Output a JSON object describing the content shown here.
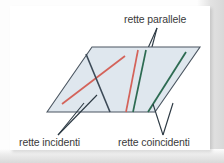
{
  "figure": {
    "title_visible": false,
    "language": "it",
    "labels": {
      "parallel": "rette parallele",
      "intersecting": "rette incidenti",
      "coincident": "rette coincidenti"
    },
    "colors": {
      "plane_fill": "#dfe7ee",
      "plane_stroke": "#4a5560",
      "line_red": "#d4635a",
      "line_green": "#2d6b52",
      "line_dark": "#3c4a57",
      "leader": "#2b3842",
      "text": "#3a3a3a",
      "card": "#ffffff",
      "backdrop": "#e2e2e2"
    },
    "plane": {
      "shape": "parallelogram",
      "points": "47,112 92,47 200,47 155,112"
    },
    "groups": [
      {
        "name": "rette incidenti",
        "kind": "intersecting",
        "description": "two lines crossing at a point inside the plane",
        "lines": [
          {
            "color": "#d4635a",
            "x1": 62,
            "y1": 104,
            "x2": 125,
            "y2": 56
          },
          {
            "color": "#3c4a57",
            "x1": 86,
            "y1": 54,
            "x2": 110,
            "y2": 112
          }
        ],
        "leaders": [
          {
            "x1": 58,
            "y1": 135,
            "x2": 97,
            "y2": 95
          },
          {
            "x1": 58,
            "y1": 135,
            "x2": 84,
            "y2": 103
          }
        ]
      },
      {
        "name": "rette parallele",
        "kind": "parallel",
        "description": "two lines that never meet, drawn side by side",
        "lines": [
          {
            "color": "#d4635a",
            "x1": 138,
            "y1": 50,
            "x2": 126,
            "y2": 112
          },
          {
            "color": "#2d6b52",
            "x1": 146,
            "y1": 50,
            "x2": 133,
            "y2": 112
          }
        ],
        "leaders": [
          {
            "x1": 157,
            "y1": 28,
            "x2": 140,
            "y2": 66
          },
          {
            "x1": 157,
            "y1": 28,
            "x2": 148,
            "y2": 62
          }
        ]
      },
      {
        "name": "rette coincidenti",
        "kind": "coincident",
        "description": "two lines lying exactly on top of one another",
        "lines": [
          {
            "color": "#2d6b52",
            "x1": 186,
            "y1": 52,
            "x2": 148,
            "y2": 112
          }
        ],
        "leaders": [
          {
            "x1": 163,
            "y1": 135,
            "x2": 153,
            "y2": 104
          },
          {
            "x1": 163,
            "y1": 135,
            "x2": 173,
            "y2": 103
          }
        ]
      }
    ]
  }
}
